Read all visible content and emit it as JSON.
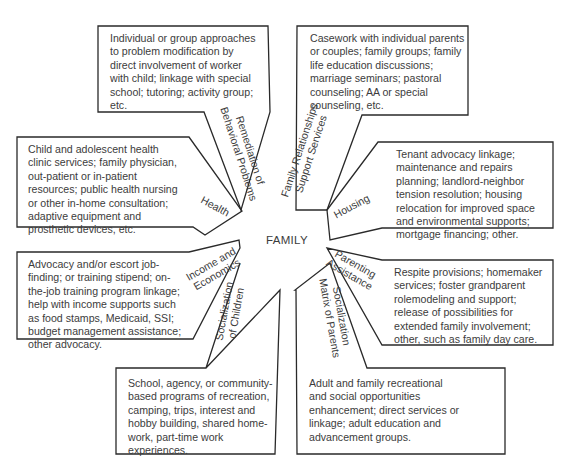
{
  "diagram": {
    "center": "FAMILY",
    "boxes": [
      {
        "id": "behavioral",
        "label": "Remediation of\nBehavioral Problems",
        "text": "Individual or group approaches\nto problem modification by\ndirect involvement of worker\nwith child; linkage with special\nschool; tutoring; activity group;\netc."
      },
      {
        "id": "family-relationships",
        "label": "Family Relationships\nSupport Services",
        "text": "Casework with individual parents\nor couples; family groups; family\nlife education discussions;\nmarriage seminars; pastoral\ncounseling; AA or special\ncounseling, etc."
      },
      {
        "id": "health",
        "label": "Health",
        "text": "Child and adolescent health\nclinic services; family physician,\nout-patient or in-patient\nresources; public health nursing\nor other in-home consultation;\nadaptive equipment and\nprosthetic devices, etc."
      },
      {
        "id": "housing",
        "label": "Housing",
        "text": "Tenant advocacy linkage;\nmaintenance and repairs\nplanning; landlord-neighbor\ntension resolution; housing\nrelocation for improved space\nand environmental supports;\nmortgage financing; other."
      },
      {
        "id": "income",
        "label": "Income and\nEconomics",
        "text": "Advocacy and/or escort job-\nfinding; or training stipend; on-\nthe-job training program linkage;\nhelp with income supports such\nas food stamps, Medicaid, SSI;\nbudget management assistance;\nother advocacy."
      },
      {
        "id": "parenting",
        "label": "Parenting\nAssistance",
        "text": "Respite provisions; homemaker\nservices; foster grandparent\nrolemodeling and support;\nrelease of possibilities for\nextended family involvement;\nother, such as family day care."
      },
      {
        "id": "socialization-children",
        "label": "Socialization\nof Children",
        "text": "School, agency, or community-\nbased programs of recreation,\ncamping, trips, interest and\nhobby building, shared home-\nwork, part-time work\nexperiences."
      },
      {
        "id": "socialization-parents",
        "label": "Socialization\nMatrix of Parents",
        "text": "Adult and family recreational\nand social opportunities\nenhancement; direct services or\nlinkage; adult education and\nadvancement groups."
      }
    ]
  }
}
